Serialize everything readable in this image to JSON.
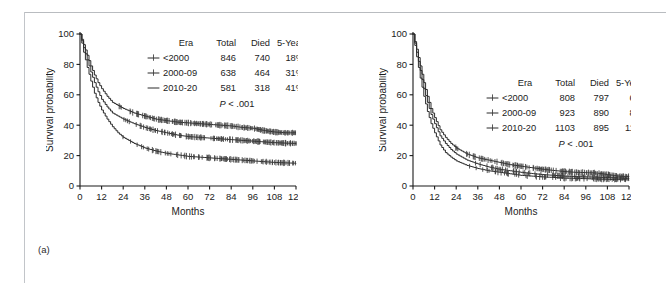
{
  "figure": {
    "panels": [
      {
        "tag": "(a)",
        "axes": {
          "ylabel": "Survival probability",
          "xlabel": "Months",
          "yticks": [
            0,
            20,
            40,
            60,
            80,
            100
          ],
          "xticks": [
            0,
            12,
            24,
            36,
            48,
            60,
            72,
            84,
            96,
            108,
            120
          ],
          "ylim": [
            0,
            100
          ],
          "xlim": [
            0,
            120
          ]
        },
        "legend": {
          "headers": [
            "Era",
            "Total",
            "Died",
            "5-Year"
          ],
          "rows": [
            {
              "marker": "censor-tick-icon",
              "era": "<2000",
              "total": "846",
              "died": "740",
              "five_year": "18%"
            },
            {
              "marker": "censor-tick-icon",
              "era": "2000-09",
              "total": "638",
              "died": "464",
              "five_year": "31%"
            },
            {
              "marker": "plain-line-icon",
              "era": "2010-20",
              "total": "581",
              "died": "318",
              "five_year": "41%"
            }
          ],
          "pvalue_italic": "P",
          "pvalue_rest": " < .001"
        }
      },
      {
        "tag": "(b)",
        "axes": {
          "ylabel": "Survival probability",
          "xlabel": "Months",
          "yticks": [
            0,
            20,
            40,
            60,
            80,
            100
          ],
          "xticks": [
            0,
            12,
            24,
            36,
            48,
            60,
            72,
            84,
            96,
            108,
            120
          ],
          "ylim": [
            0,
            100
          ],
          "xlim": [
            0,
            120
          ]
        },
        "legend": {
          "headers": [
            "Era",
            "Total",
            "Died",
            "5-Year"
          ],
          "rows": [
            {
              "marker": "censor-tick-icon",
              "era": "<2000",
              "total": "808",
              "died": "797",
              "five_year": "6%"
            },
            {
              "marker": "censor-tick-icon",
              "era": "2000-09",
              "total": "923",
              "died": "890",
              "five_year": "8%"
            },
            {
              "marker": "censor-tick-icon",
              "era": "2010-20",
              "total": "1103",
              "died": "895",
              "five_year": "11%"
            }
          ],
          "pvalue_italic": "P",
          "pvalue_rest": " < .001"
        }
      }
    ]
  },
  "chart_data": [
    {
      "type": "line",
      "panel": "(a)",
      "title": "",
      "xlabel": "Months",
      "ylabel": "Survival probability",
      "xlim": [
        0,
        120
      ],
      "ylim": [
        0,
        100
      ],
      "grid": false,
      "legend_position": "upper-right",
      "x": [
        0,
        2,
        4,
        6,
        8,
        10,
        12,
        15,
        18,
        21,
        24,
        30,
        36,
        42,
        48,
        54,
        60,
        66,
        72,
        78,
        84,
        90,
        96,
        102,
        108,
        114,
        120
      ],
      "series": [
        {
          "name": "2010-20",
          "five_year": 41,
          "values": [
            100,
            93,
            86,
            79,
            73,
            68,
            64,
            59,
            55,
            53,
            51,
            48,
            46,
            44,
            43,
            42,
            41.5,
            41,
            40.5,
            40,
            39.5,
            38.5,
            38,
            36.5,
            35.5,
            35,
            35
          ]
        },
        {
          "name": "2000-09",
          "five_year": 31,
          "values": [
            100,
            91,
            83,
            75,
            68,
            62,
            57,
            52,
            48,
            46,
            44,
            41,
            38.5,
            36.5,
            35,
            33.5,
            32.5,
            32,
            31.5,
            31,
            30.5,
            30,
            29.5,
            29,
            28.5,
            28.2,
            28
          ]
        },
        {
          "name": "<2000",
          "five_year": 18,
          "values": [
            100,
            88,
            78,
            69,
            61,
            55,
            50,
            44,
            39,
            35,
            32,
            28,
            25,
            23,
            21.5,
            20.5,
            19.5,
            19,
            18.5,
            18,
            17.5,
            17,
            16.5,
            16,
            15.5,
            15.2,
            15
          ]
        }
      ]
    },
    {
      "type": "line",
      "panel": "(b)",
      "title": "",
      "xlabel": "Months",
      "ylabel": "Survival probability",
      "xlim": [
        0,
        120
      ],
      "ylim": [
        0,
        100
      ],
      "grid": false,
      "legend_position": "upper-right",
      "x": [
        0,
        2,
        4,
        6,
        8,
        10,
        12,
        15,
        18,
        21,
        24,
        30,
        36,
        42,
        48,
        54,
        60,
        66,
        72,
        78,
        84,
        90,
        96,
        102,
        108,
        114,
        120
      ],
      "series": [
        {
          "name": "2010-20",
          "five_year": 11,
          "values": [
            100,
            90,
            79,
            68,
            59,
            51,
            45,
            37,
            32,
            28,
            25,
            21,
            18.5,
            17,
            15.5,
            14,
            13,
            12,
            11,
            10.2,
            9.5,
            9,
            8.8,
            8.5,
            7.5,
            6.5,
            6.2
          ]
        },
        {
          "name": "2000-09",
          "five_year": 8,
          "values": [
            100,
            88,
            76,
            64,
            55,
            47,
            41,
            33,
            28,
            24,
            21,
            17,
            14.5,
            12.5,
            11,
            10,
            9,
            8.2,
            7.5,
            7,
            6.5,
            6.2,
            6,
            5.8,
            5.5,
            5.2,
            5
          ]
        },
        {
          "name": "<2000",
          "five_year": 6,
          "values": [
            100,
            85,
            71,
            59,
            49,
            41,
            35,
            27,
            22,
            19,
            16.5,
            13.5,
            11.5,
            10,
            9,
            8,
            7,
            6.5,
            6,
            5.6,
            5.2,
            5,
            4.8,
            4.6,
            4.4,
            4.2,
            4
          ]
        }
      ]
    }
  ]
}
